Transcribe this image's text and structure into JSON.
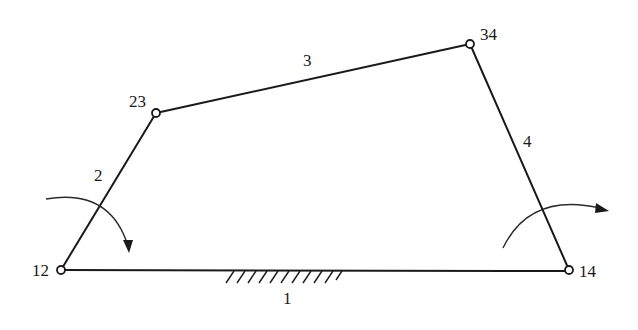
{
  "diagram": {
    "type": "four-bar linkage",
    "links": [
      {
        "id": "1",
        "label": "1",
        "from": "12",
        "to": "14",
        "kind": "ground"
      },
      {
        "id": "2",
        "label": "2",
        "from": "12",
        "to": "23",
        "kind": "crank"
      },
      {
        "id": "3",
        "label": "3",
        "from": "23",
        "to": "34",
        "kind": "coupler"
      },
      {
        "id": "4",
        "label": "4",
        "from": "34",
        "to": "14",
        "kind": "rocker"
      }
    ],
    "joints": [
      {
        "id": "12",
        "label": "12"
      },
      {
        "id": "23",
        "label": "23"
      },
      {
        "id": "34",
        "label": "34"
      },
      {
        "id": "14",
        "label": "14"
      }
    ],
    "arrows": [
      {
        "name": "input-rotation",
        "at_joint": "12",
        "direction": "clockwise"
      },
      {
        "name": "output-rotation",
        "at_joint": "14",
        "direction": "clockwise"
      }
    ]
  }
}
